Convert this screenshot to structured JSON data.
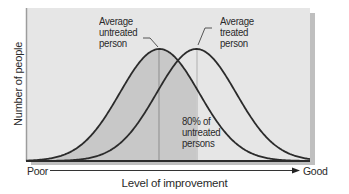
{
  "figure": {
    "y_axis_label": "Number of people",
    "x_axis_label": "Level of improvement",
    "x_axis_left_end": "Poor",
    "x_axis_right_end": "Good",
    "annotations": {
      "untreated_line1": "Average",
      "untreated_line2": "untreated",
      "untreated_line3": "person",
      "treated_line1": "Average",
      "treated_line2": "treated",
      "treated_line3": "person",
      "overlap_line1": "80% of",
      "overlap_line2": "untreated",
      "overlap_line3": "persons"
    },
    "colors": {
      "plot_background": "#e6e6e6",
      "shaded_region": "#c9c9c9",
      "curve": "#2b2b2b",
      "mean_line": "#9a9a9a",
      "shadow": "#7a7a7a"
    }
  },
  "chart_data": {
    "type": "line",
    "title": "",
    "xlabel": "Level of improvement",
    "ylabel": "Number of people",
    "x_range_labels": [
      "Poor",
      "Good"
    ],
    "series": [
      {
        "name": "Untreated persons",
        "distribution": "normal",
        "mean_relative": 0.47,
        "sd_relative": 0.14
      },
      {
        "name": "Treated persons",
        "distribution": "normal",
        "mean_relative": 0.6,
        "sd_relative": 0.14
      }
    ],
    "annotations": [
      {
        "text": "Average untreated person",
        "points_to": "untreated mean"
      },
      {
        "text": "Average treated person",
        "points_to": "treated mean"
      },
      {
        "text": "80% of untreated persons",
        "describes": "shaded area under untreated curve below treated mean"
      }
    ],
    "shaded_fraction_of_untreated_below_treated_mean": 0.8,
    "grid": false,
    "legend": "none"
  }
}
